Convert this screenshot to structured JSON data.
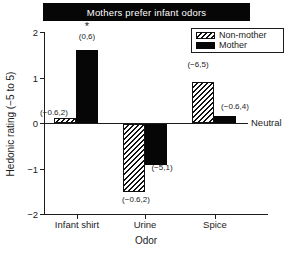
{
  "colors": {
    "bar_fill": "#000000",
    "background": "#ffffff",
    "banner_background": "#000000",
    "banner_text": "#ffffff",
    "text": "#1c1c1c"
  },
  "chart_data": {
    "type": "bar",
    "title": "Mothers prefer infant odors",
    "xlabel": "Odor",
    "ylabel": "Hedonic rating (−5 to 5)",
    "categories": [
      "Infant shirt",
      "Urine",
      "Spice"
    ],
    "series": [
      {
        "name": "Non-mother",
        "style": "hatched",
        "values": [
          0.1,
          -1.5,
          0.9
        ],
        "range_labels": [
          "(−0.6,2)",
          "(−0.6,2)",
          "(−6,5)"
        ]
      },
      {
        "name": "Mother",
        "style": "solid",
        "values": [
          1.6,
          -0.9,
          0.15
        ],
        "range_labels": [
          "(0,6)",
          "(−5,1)",
          "(−0.6,4)"
        ]
      }
    ],
    "significance_marker": {
      "text": "*",
      "category": "Infant shirt",
      "series": "Mother"
    },
    "ylim": [
      -2,
      2
    ],
    "yticks": [
      2,
      1,
      0,
      -1,
      -2
    ],
    "ytick_labels": [
      "2",
      "1",
      "0",
      "−1",
      "−2"
    ],
    "zero_line_label": "Neutral",
    "legend_position": "top-right",
    "grid": false
  }
}
